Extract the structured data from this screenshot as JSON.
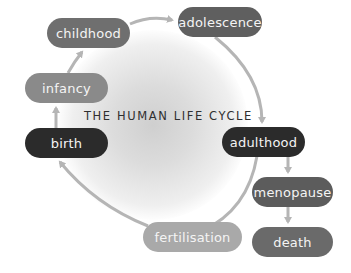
{
  "diagram": {
    "title": "THE HUMAN LIFE CYCLE",
    "colors": {
      "dark": "#2b2b2b",
      "medium": "#666666",
      "light": "#8f8f8f",
      "pale": "#a9a9a9",
      "arrow": "#b5b5b5"
    },
    "nodes": [
      {
        "id": "childhood",
        "label": "childhood"
      },
      {
        "id": "adolescence",
        "label": "adolescence"
      },
      {
        "id": "infancy",
        "label": "infancy"
      },
      {
        "id": "birth",
        "label": "birth"
      },
      {
        "id": "adulthood",
        "label": "adulthood"
      },
      {
        "id": "menopause",
        "label": "menopause"
      },
      {
        "id": "death",
        "label": "death"
      },
      {
        "id": "fertilisation",
        "label": "fertilisation"
      }
    ],
    "edges": [
      {
        "from": "birth",
        "to": "infancy"
      },
      {
        "from": "infancy",
        "to": "childhood"
      },
      {
        "from": "childhood",
        "to": "adolescence"
      },
      {
        "from": "adolescence",
        "to": "adulthood"
      },
      {
        "from": "adulthood",
        "to": "fertilisation"
      },
      {
        "from": "fertilisation",
        "to": "birth"
      },
      {
        "from": "adulthood",
        "to": "menopause"
      },
      {
        "from": "menopause",
        "to": "death"
      }
    ]
  }
}
